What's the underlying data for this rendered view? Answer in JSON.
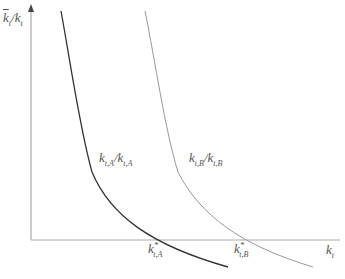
{
  "diagram": {
    "y_axis_label": {
      "base": "k",
      "dot": true,
      "sub": "t",
      "slash": "/",
      "base2": "k",
      "sub2": "t"
    },
    "x_axis_label": {
      "base": "k",
      "sub": "t"
    },
    "curves": [
      {
        "name": "A",
        "label_base": "k",
        "label_sub": "t,A",
        "label_base2": "k",
        "label_sub2": "t,A",
        "star_label_base": "k",
        "star_sup": "*",
        "star_sub": "t,A",
        "color": "#333333"
      },
      {
        "name": "B",
        "label_base": "k",
        "label_sub": "t,B",
        "label_base2": "k",
        "label_sub2": "t,B",
        "star_label_base": "k",
        "star_sup": "*",
        "star_sub": "t,B",
        "color": "#999999"
      }
    ],
    "colors": {
      "axis": "#999999",
      "text": "#555555"
    }
  }
}
